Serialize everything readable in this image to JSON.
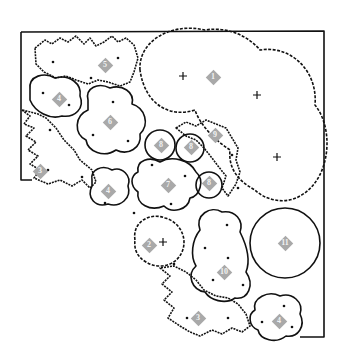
{
  "diagram": {
    "type": "garden planting plan",
    "colors": {
      "outline": "#111111",
      "label_marker": "#a9a9a9",
      "label_text": "#f2f2f2",
      "background": "#ffffff"
    },
    "labels": [
      {
        "id": "l1a",
        "text": "1",
        "x": 213,
        "y": 77
      },
      {
        "id": "l2",
        "text": "2",
        "x": 149,
        "y": 245
      },
      {
        "id": "l3a",
        "text": "3",
        "x": 40,
        "y": 171
      },
      {
        "id": "l3b",
        "text": "3",
        "x": 198,
        "y": 318
      },
      {
        "id": "l4a",
        "text": "4",
        "x": 59,
        "y": 99
      },
      {
        "id": "l4b",
        "text": "4",
        "x": 108,
        "y": 191
      },
      {
        "id": "l4c",
        "text": "4",
        "x": 279,
        "y": 321
      },
      {
        "id": "l5",
        "text": "5",
        "x": 105,
        "y": 65
      },
      {
        "id": "l6",
        "text": "6",
        "x": 110,
        "y": 122
      },
      {
        "id": "l7",
        "text": "7",
        "x": 168,
        "y": 185
      },
      {
        "id": "l8a",
        "text": "8",
        "x": 161,
        "y": 145
      },
      {
        "id": "l8b",
        "text": "8",
        "x": 191,
        "y": 147
      },
      {
        "id": "l8c",
        "text": "8",
        "x": 209,
        "y": 183
      },
      {
        "id": "l9",
        "text": "9",
        "x": 215,
        "y": 135
      },
      {
        "id": "l10",
        "text": "10",
        "x": 224,
        "y": 272
      },
      {
        "id": "l11",
        "text": "11",
        "x": 285,
        "y": 243
      }
    ]
  }
}
